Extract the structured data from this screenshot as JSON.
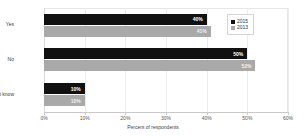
{
  "chart_data": {
    "type": "bar",
    "orientation": "horizontal",
    "title": "",
    "subtitle": "",
    "xlabel": "Percent of respondents",
    "ylabel": "",
    "categories": [
      "Yes",
      "No",
      "Don't know"
    ],
    "series": [
      {
        "name": "2015",
        "color": "#111111",
        "values": [
          40,
          50,
          10
        ],
        "data_labels": [
          "40%",
          "50%",
          "10%"
        ]
      },
      {
        "name": "2013",
        "color": "#a9a9a9",
        "values": [
          41,
          52,
          10
        ],
        "data_labels": [
          "41%",
          "52%",
          "10%"
        ]
      }
    ],
    "xlim": [
      0,
      60
    ],
    "x_ticks": [
      0,
      10,
      20,
      30,
      40,
      50,
      60
    ],
    "x_tick_labels": [
      "0%",
      "10%",
      "20%",
      "30%",
      "40%",
      "50%",
      "60%"
    ],
    "grid": true,
    "legend_position": "top-right",
    "legend_entries": [
      "2015",
      "2013"
    ]
  },
  "axis": {
    "x_title": "Percent of respondents"
  },
  "colors": {
    "series_2015": "#111111",
    "series_2013": "#a9a9a9",
    "grid": "#ececec",
    "axis": "#c9c9c9",
    "background": "#ffffff"
  }
}
